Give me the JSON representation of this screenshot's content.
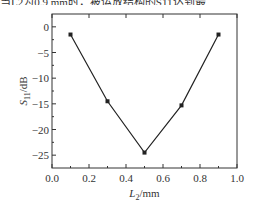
{
  "caption_fragment": "当L2为0.9 mm时，被运放结构的S11达到最",
  "chart_data": {
    "type": "line",
    "title": "",
    "xlabel": "L2/mm",
    "ylabel": "S11/dB",
    "xlim": [
      0.0,
      1.0
    ],
    "ylim": [
      -27.5,
      2.5
    ],
    "xticks": [
      "0.0",
      "0.2",
      "0.4",
      "0.6",
      "0.8",
      "1.0"
    ],
    "yticks": [
      "0",
      "-5",
      "-10",
      "-15",
      "-20",
      "-25"
    ],
    "grid": false,
    "legend": null,
    "series": [
      {
        "name": "S11",
        "x": [
          0.1,
          0.3,
          0.5,
          0.7,
          0.9
        ],
        "values": [
          -1.5,
          -14.5,
          -24.5,
          -15.3,
          -1.5
        ],
        "marker": "square",
        "color": "#222222"
      }
    ]
  }
}
